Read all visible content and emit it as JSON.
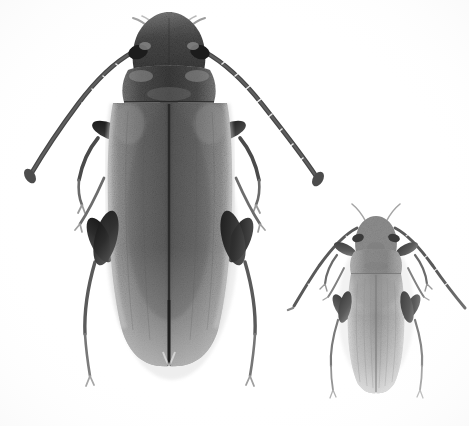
{
  "image": {
    "kind": "specimen-photograph",
    "subject": "two beetles, dorsal view",
    "background_color": "#ffffff",
    "width": 469,
    "height": 426,
    "color_mode": "grayscale",
    "visible_text": "",
    "caption": ""
  },
  "palette": {
    "background": "#ffffff",
    "body_dark": "#3a3a3a",
    "body_mid": "#6f6f6f",
    "body_light": "#a9a9a9",
    "elytra_pale": "#c9c9c9",
    "leg_dark": "#2e2e2e",
    "leg_mid": "#5c5c5c",
    "small_body": "#9a9a9a",
    "small_pale": "#cfcfcf",
    "shadow": "#d8d8d8",
    "suture_line": "#2b2b2b"
  },
  "specimens": [
    {
      "id": "large-beetle",
      "label": "Large beetle specimen",
      "position": "left",
      "relative_size": "large",
      "tone": "dark gray",
      "center_x": 169,
      "center_y": 200,
      "body_length_px": 350,
      "body_width_px": 120,
      "parts": [
        {
          "name": "head",
          "label": "Head"
        },
        {
          "name": "antenna-left",
          "label": "Left antenna"
        },
        {
          "name": "antenna-right",
          "label": "Right antenna"
        },
        {
          "name": "pronotum",
          "label": "Pronotum"
        },
        {
          "name": "scutellum",
          "label": "Scutellum"
        },
        {
          "name": "elytron-left",
          "label": "Left elytron"
        },
        {
          "name": "elytron-right",
          "label": "Right elytron"
        },
        {
          "name": "elytral-suture",
          "label": "Elytral suture"
        },
        {
          "name": "foreleg-left",
          "label": "Left foreleg"
        },
        {
          "name": "foreleg-right",
          "label": "Right foreleg"
        },
        {
          "name": "midleg-left",
          "label": "Left midleg"
        },
        {
          "name": "midleg-right",
          "label": "Right midleg"
        },
        {
          "name": "hindleg-left",
          "label": "Left hindleg"
        },
        {
          "name": "hindleg-right",
          "label": "Right hindleg"
        }
      ]
    },
    {
      "id": "small-beetle",
      "label": "Small beetle specimen",
      "position": "right",
      "relative_size": "small",
      "tone": "light gray",
      "center_x": 376,
      "center_y": 305,
      "body_length_px": 185,
      "body_width_px": 60,
      "parts": [
        {
          "name": "head",
          "label": "Head"
        },
        {
          "name": "antenna-left",
          "label": "Left antenna"
        },
        {
          "name": "antenna-right",
          "label": "Right antenna"
        },
        {
          "name": "pronotum",
          "label": "Pronotum"
        },
        {
          "name": "elytron-left",
          "label": "Left elytron"
        },
        {
          "name": "elytron-right",
          "label": "Right elytron"
        },
        {
          "name": "elytral-suture",
          "label": "Elytral suture"
        },
        {
          "name": "foreleg-left",
          "label": "Left foreleg"
        },
        {
          "name": "foreleg-right",
          "label": "Right foreleg"
        },
        {
          "name": "midleg-left",
          "label": "Left midleg"
        },
        {
          "name": "midleg-right",
          "label": "Right midleg"
        },
        {
          "name": "hindleg-left",
          "label": "Left hindleg"
        },
        {
          "name": "hindleg-right",
          "label": "Right hindleg"
        }
      ]
    }
  ]
}
